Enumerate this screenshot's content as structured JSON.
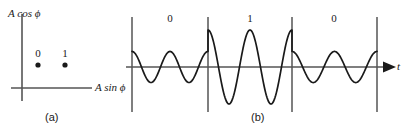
{
  "figure": {
    "panel_a": {
      "caption": "(a)",
      "y_axis_label": "A cos ϕ",
      "x_axis_label": "A sin ϕ",
      "points": [
        {
          "label": "0",
          "x": 38,
          "y": 65
        },
        {
          "label": "1",
          "x": 65,
          "y": 65
        }
      ],
      "axis_color": "#555555",
      "point_color": "#1a1a1a"
    },
    "panel_b": {
      "caption": "(b)",
      "time_axis_label": "t",
      "bits": [
        "0",
        "1",
        "0"
      ],
      "boundaries": [
        132,
        208,
        292,
        377
      ],
      "axis_color": "#555555",
      "wave_color": "#1a1a1a"
    }
  },
  "chart_data": {
    "type": "line",
    "title": "",
    "xlabel": "t",
    "ylabel": "",
    "grid": false,
    "legend": null,
    "subplots": [
      {
        "name": "signal-constellation",
        "type": "scatter",
        "label": "(a)",
        "xlabel": "A sin ϕ",
        "ylabel": "A cos ϕ",
        "x": [
          0.4,
          1.0
        ],
        "y": [
          0.0,
          0.0
        ],
        "point_labels": [
          "0",
          "1"
        ],
        "xlim": [
          -0.2,
          1.6
        ],
        "ylim": [
          -0.8,
          1.2
        ]
      },
      {
        "name": "ask-waveform",
        "type": "line",
        "label": "(b)",
        "xlabel": "t",
        "modulation": "ASK",
        "symbols": [
          "0",
          "1",
          "0"
        ],
        "symbol_amplitudes": [
          0.42,
          1.0,
          0.42
        ],
        "cycles_per_symbol": 2,
        "carrier_phase": "cosine",
        "symbol_boundaries_px": [
          132,
          208,
          292,
          377
        ],
        "baseline_y_px": 67,
        "ylim": [
          -1.1,
          1.1
        ]
      }
    ]
  }
}
